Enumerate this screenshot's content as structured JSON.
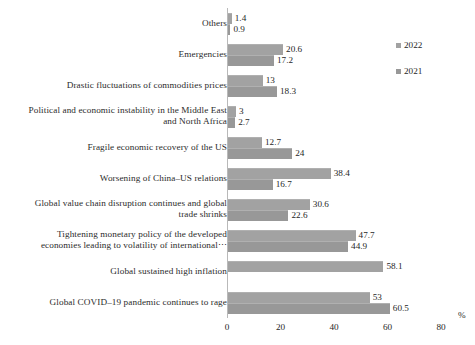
{
  "chart_data": {
    "type": "bar",
    "orientation": "horizontal",
    "title": "",
    "xlabel": "%",
    "ylabel": "",
    "xlim": [
      0,
      80
    ],
    "xticks": [
      0,
      20,
      40,
      60,
      80
    ],
    "grid": false,
    "legend_position": "right",
    "categories": [
      "Others",
      "Emergencies",
      "Drastic fluctuations of commodities prices",
      "Political and economic instability in the Middle East\nand North Africa",
      "Fragile economic recovery of the US",
      "Worsening of China–US relations",
      "Global value chain disruption continues and global\ntrade shrinks",
      "Tightening monetary policy of the developed\neconomies leading to volatility of international⋯",
      "Global sustained high inflation",
      "Global COVID–19 pandemic continues to rage"
    ],
    "series": [
      {
        "name": "2022",
        "color": "#a2a2a2",
        "values": [
          1.4,
          20.6,
          13,
          3,
          12.7,
          38.4,
          30.6,
          47.7,
          58.1,
          53
        ],
        "labels": [
          "1.4",
          "20.6",
          "13",
          "3",
          "12.7",
          "38.4",
          "30.6",
          "47.7",
          "58.1",
          "53"
        ]
      },
      {
        "name": "2021",
        "color": "#989898",
        "values": [
          0.9,
          17.2,
          18.3,
          2.7,
          24,
          16.7,
          22.6,
          44.9,
          null,
          60.5
        ],
        "labels": [
          "0.9",
          "17.2",
          "18.3",
          "2.7",
          "24",
          "16.7",
          "22.6",
          "44.9",
          "",
          "60.5"
        ]
      }
    ]
  },
  "legend": {
    "items": [
      {
        "label": "2022"
      },
      {
        "label": "2021"
      }
    ]
  },
  "axis": {
    "unit": "%",
    "tick_labels": [
      "0",
      "20",
      "40",
      "60",
      "80"
    ]
  }
}
